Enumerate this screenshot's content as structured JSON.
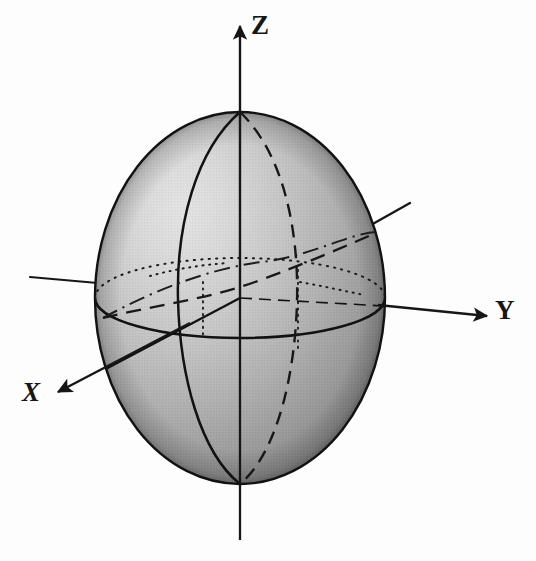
{
  "figure": {
    "kind": "3d-ellipsoid-coordinate-axes-diagram",
    "title": "",
    "background_color": "#fdfdfd",
    "ink_color": "#161616",
    "axes": [
      {
        "id": "x",
        "label": "X",
        "direction": "down-left",
        "arrow": true,
        "label_position": {
          "x": 22,
          "y": 379
        },
        "tip": {
          "x": 55,
          "y": 393
        },
        "tail": {
          "x": 410,
          "y": 203
        }
      },
      {
        "id": "y",
        "label": "Y",
        "direction": "right",
        "arrow": true,
        "label_position": {
          "x": 495,
          "y": 297
        },
        "tip": {
          "x": 487,
          "y": 316
        },
        "tail": {
          "x": 30,
          "y": 277
        }
      },
      {
        "id": "z",
        "label": "Z",
        "direction": "up",
        "arrow": true,
        "label_position": {
          "x": 251,
          "y": 12
        },
        "tip": {
          "x": 240,
          "y": 22
        },
        "tail": {
          "x": 240,
          "y": 540
        }
      }
    ],
    "body": {
      "shape": "ellipsoid",
      "center": {
        "x": 240,
        "y": 298
      },
      "radius_x": 145,
      "radius_y": 186,
      "shading": "matte-gray-halftone",
      "highlight_color": "#dcdcdc",
      "midtone_color": "#b0b0b0",
      "shadow_color": "#6f6f6f",
      "outline_color": "#121212"
    },
    "curves": [
      {
        "id": "equator-front",
        "style": "solid",
        "description": "front half of the equatorial ellipse"
      },
      {
        "id": "equator-back",
        "style": "dotted",
        "description": "rear half of the equatorial ellipse"
      },
      {
        "id": "prime-meridian-front",
        "style": "solid",
        "description": "front meridian through the poles"
      },
      {
        "id": "meridian-back",
        "style": "dashed",
        "description": "rear meridian through the poles"
      },
      {
        "id": "tilted-great-circle-front",
        "style": "dashed",
        "description": "inclined great circle, near half"
      },
      {
        "id": "tilted-great-circle-back",
        "style": "dash-dot",
        "description": "inclined great circle, far half"
      },
      {
        "id": "polar-axis-hidden",
        "style": "dash-dot",
        "description": "polar axis segment inside the body"
      }
    ]
  }
}
